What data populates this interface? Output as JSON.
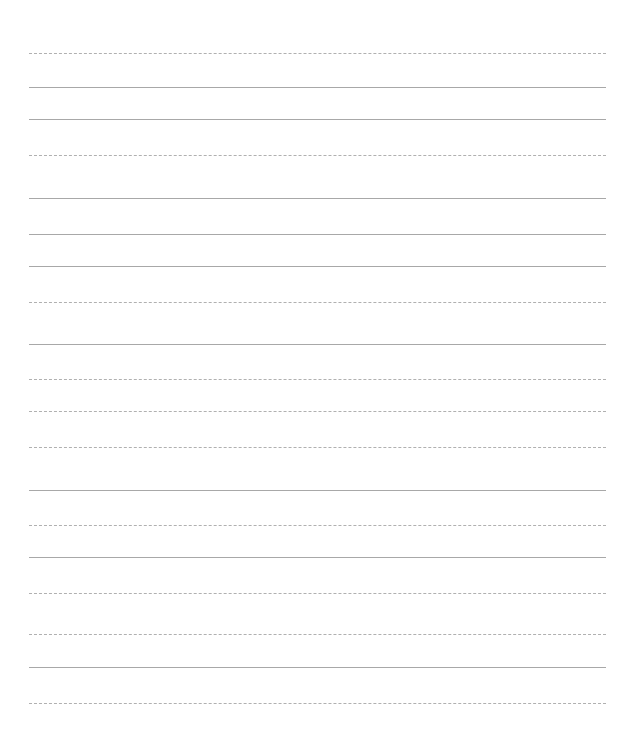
{
  "page": {
    "type": "lined-paper",
    "line_color": "#a8a8a8",
    "line_left": 29,
    "line_right": 606,
    "lines": [
      {
        "y": 53,
        "style": "dashed"
      },
      {
        "y": 87,
        "style": "solid"
      },
      {
        "y": 119,
        "style": "solid"
      },
      {
        "y": 155,
        "style": "dashed"
      },
      {
        "y": 198,
        "style": "solid"
      },
      {
        "y": 234,
        "style": "solid"
      },
      {
        "y": 266,
        "style": "solid"
      },
      {
        "y": 302,
        "style": "dashed"
      },
      {
        "y": 344,
        "style": "solid"
      },
      {
        "y": 379,
        "style": "dashed"
      },
      {
        "y": 411,
        "style": "dashed"
      },
      {
        "y": 447,
        "style": "dashed"
      },
      {
        "y": 490,
        "style": "solid"
      },
      {
        "y": 525,
        "style": "dashed"
      },
      {
        "y": 557,
        "style": "solid"
      },
      {
        "y": 593,
        "style": "dashed"
      },
      {
        "y": 634,
        "style": "dashed"
      },
      {
        "y": 667,
        "style": "solid"
      },
      {
        "y": 703,
        "style": "dashed"
      }
    ]
  }
}
